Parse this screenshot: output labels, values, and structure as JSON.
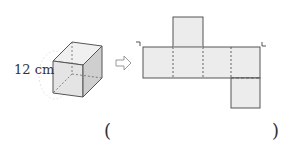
{
  "cube": {
    "edge_label": "12 cm"
  },
  "arrow": {
    "icon": "hollow-right-arrow"
  },
  "net": {
    "shape": "cube-net",
    "faces": 6
  },
  "answer": {
    "open_paren": "(",
    "close_paren": ")"
  },
  "colors": {
    "face_fill": "#ececec",
    "side_fill": "#d4d4d4",
    "stroke": "#555555"
  }
}
